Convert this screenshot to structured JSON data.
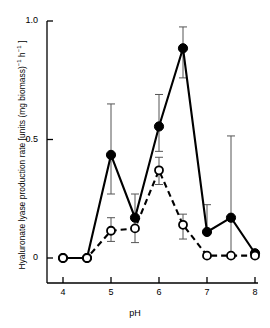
{
  "chart_data": {
    "type": "line",
    "title": "",
    "xlabel": "pH",
    "ylabel": "Hyaluronate lyase production rate [units (mg biomass)⁻¹ h⁻¹]",
    "ylabel_parts": {
      "lead": "Hyaluronate lyase production rate [units (mg biomass)",
      "exp1": "−1",
      "mid": " h",
      "exp2": "−1",
      "tail": " ]"
    },
    "x": [
      4,
      4.5,
      5,
      5.5,
      6,
      6.5,
      7,
      7.5,
      8
    ],
    "xlim": [
      3.8,
      8.1
    ],
    "ylim": [
      0,
      1.0
    ],
    "xticks": [
      4,
      5,
      6,
      7,
      8
    ],
    "xticklabels": [
      "4",
      "5",
      "6",
      "7",
      "8"
    ],
    "yticks": [
      0,
      0.5,
      1.0
    ],
    "yticklabels": [
      "0",
      "0.5",
      "1.0"
    ],
    "grid": false,
    "legend": "none",
    "series": [
      {
        "name": "filled-circles-solid",
        "marker": "filled-circle",
        "linestyle": "solid",
        "color": "#000000",
        "values": [
          0,
          0,
          0.435,
          0.17,
          0.555,
          0.885,
          0.11,
          0.17,
          0.02
        ],
        "error_upper": [
          0,
          0,
          0.215,
          0.1,
          0.135,
          0.09,
          0.115,
          0.345,
          0.0
        ],
        "error_lower": [
          0,
          0,
          0.165,
          0.045,
          0.105,
          0.125,
          0.0,
          0.155,
          0.0
        ]
      },
      {
        "name": "open-circles-dashed",
        "marker": "open-circle",
        "linestyle": "dashed",
        "color": "#000000",
        "values": [
          0,
          0,
          0.115,
          0.125,
          0.37,
          0.14,
          0.01,
          0.01,
          0.01
        ],
        "error_upper": [
          0,
          0,
          0.055,
          0.0,
          0.055,
          0.045,
          0.0,
          0.0,
          0.0
        ],
        "error_lower": [
          0,
          0,
          0.045,
          0.06,
          0.06,
          0.06,
          0.0,
          0.0,
          0.0
        ]
      }
    ]
  }
}
